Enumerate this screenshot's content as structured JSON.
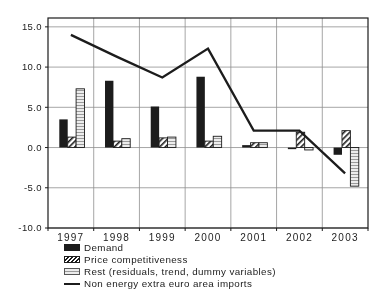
{
  "figure": {
    "background": "#ffffff",
    "ink": "#1c1c1c",
    "grid_color": "#8f8f8f"
  },
  "chart_data": {
    "type": "bar",
    "subtype": "grouped-bars-with-line-overlay",
    "title": "",
    "xlabel": "",
    "ylabel": "",
    "categories": [
      "1997",
      "1998",
      "1999",
      "2000",
      "2001",
      "2002",
      "2003"
    ],
    "series": [
      {
        "name": "Demand",
        "type": "bar",
        "style": "solid-black",
        "values": [
          3.5,
          8.3,
          5.1,
          8.8,
          0.3,
          -0.1,
          -0.9
        ]
      },
      {
        "name": "Price competitiveness",
        "type": "bar",
        "style": "diagonal-hatch",
        "values": [
          1.3,
          0.8,
          1.2,
          0.8,
          0.6,
          1.9,
          2.1
        ]
      },
      {
        "name": "Rest (residuals, trend, dummy variables)",
        "type": "bar",
        "style": "horizontal-stripes",
        "values": [
          7.3,
          1.1,
          1.3,
          1.4,
          0.6,
          -0.3,
          -4.8
        ]
      },
      {
        "name": "Non energy extra euro area imports",
        "type": "line",
        "style": "solid-line",
        "values": [
          14.0,
          11.3,
          8.7,
          12.3,
          2.1,
          2.1,
          -3.2
        ]
      }
    ],
    "yticks": [
      {
        "label": "15.0",
        "value": 15
      },
      {
        "label": "10.0",
        "value": 10
      },
      {
        "label": "5.0",
        "value": 5
      },
      {
        "label": "0.0",
        "value": 0
      },
      {
        "label": "-5.0",
        "value": -5
      },
      {
        "label": "-10.0",
        "value": -10
      }
    ],
    "ylim": [
      -10.0,
      16.1
    ],
    "grid": true,
    "legend_position": "bottom-left"
  }
}
